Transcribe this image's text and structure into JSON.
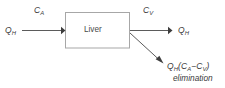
{
  "diagram": {
    "type": "hepatic-clearance-flow-diagram",
    "background_color": "#ffffff",
    "line_color": "#5b5b5b",
    "box_border_color": "#a7a7a7",
    "text_color": "#3a3a3a"
  },
  "node": {
    "liver_label": "Liver"
  },
  "inflow": {
    "rate_symbol": "Q",
    "rate_subscript": "H",
    "concentration_symbol": "C",
    "concentration_subscript": "A"
  },
  "outflow": {
    "rate_symbol": "Q",
    "rate_subscript": "H",
    "concentration_symbol": "C",
    "concentration_subscript": "V"
  },
  "elimination": {
    "rate_symbol": "Q",
    "rate_subscript": "H",
    "open_paren": "(",
    "term_a_symbol": "C",
    "term_a_subscript": "A",
    "minus": "−",
    "term_v_symbol": "C",
    "term_v_subscript": "V",
    "close_paren": ")",
    "caption": "elimination"
  }
}
